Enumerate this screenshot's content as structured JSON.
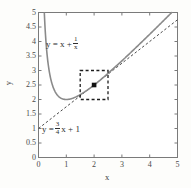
{
  "chart_data": {
    "type": "line",
    "title": "",
    "xlabel": "x",
    "ylabel": "y",
    "xlim": [
      0,
      5
    ],
    "ylim": [
      0,
      5
    ],
    "grid": false,
    "legend": "inline-annotations",
    "xticks": [
      "0",
      "1",
      "2",
      "3",
      "4",
      "5"
    ],
    "xtick_values": [
      0,
      1,
      2,
      3,
      4,
      5
    ],
    "yticks": [
      "0",
      "0.5",
      "1",
      "1.5",
      "2",
      "2.5",
      "3",
      "3.5",
      "4",
      "4.5",
      "5"
    ],
    "ytick_values": [
      0,
      0.5,
      1,
      1.5,
      2,
      2.5,
      3,
      3.5,
      4,
      4.5,
      5
    ],
    "series": [
      {
        "name": "y = x + 1/x",
        "style": "solid",
        "color": "#8a8a8a",
        "expression": "x + 1/x",
        "x": [
          0.21,
          0.25,
          0.3,
          0.35,
          0.4,
          0.45,
          0.5,
          0.6,
          0.7,
          0.8,
          0.9,
          1.0,
          1.2,
          1.4,
          1.6,
          1.8,
          2.0,
          2.25,
          2.5,
          3.0,
          3.5,
          4.0,
          4.5,
          5.0
        ],
        "y": [
          4.97,
          4.25,
          3.63,
          3.21,
          2.9,
          2.67,
          2.5,
          2.27,
          2.13,
          2.05,
          2.01,
          2.0,
          2.03,
          2.11,
          2.23,
          2.36,
          2.5,
          2.69,
          2.9,
          3.33,
          3.79,
          4.25,
          4.72,
          5.2
        ]
      },
      {
        "name": "y = (3/4)x + 1",
        "style": "dashed",
        "color": "#4a4a4a",
        "expression": "0.75x + 1",
        "x": [
          0,
          5
        ],
        "y": [
          1.0,
          4.75
        ]
      }
    ],
    "annotations": [
      {
        "name": "curve-equation",
        "kind": "equation",
        "lhs": "y = x +",
        "fraction": {
          "numerator": "1",
          "denominator": "x"
        },
        "suffix": ""
      },
      {
        "name": "line-equation",
        "kind": "equation",
        "lhs": "y =",
        "fraction": {
          "numerator": "3",
          "denominator": "4"
        },
        "suffix": "x + 1"
      }
    ],
    "marker_point": {
      "name": "tangency-point",
      "x": 2.0,
      "y": 2.5,
      "style": "filled-square"
    },
    "highlight_box": {
      "name": "zoom-box",
      "x_range": [
        1.5,
        2.5
      ],
      "y_range": [
        2.0,
        3.0
      ],
      "style": "dashed"
    }
  },
  "axes": {
    "x_label": "x",
    "y_label": "y"
  },
  "eq_curve": {
    "lhs": "y = x +",
    "num": "1",
    "den": "x"
  },
  "eq_line": {
    "lhs": "y =",
    "num": "3",
    "den": "4",
    "suffix": "x + 1"
  }
}
